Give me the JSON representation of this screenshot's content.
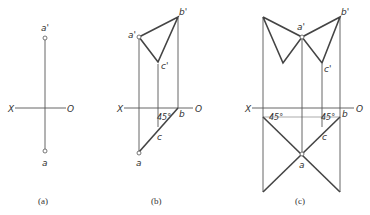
{
  "panels": [
    {
      "id": "a",
      "caption": "(a)",
      "axis": {
        "x_label": "X",
        "o_label": "O"
      },
      "points": {
        "a_prime": "a'",
        "a": "a"
      }
    },
    {
      "id": "b",
      "caption": "(b)",
      "axis": {
        "x_label": "X",
        "o_label": "O"
      },
      "points": {
        "a_prime": "a'",
        "b_prime": "b'",
        "c_prime": "c'",
        "a": "a",
        "b": "b",
        "c": "c"
      },
      "angle": "45°"
    },
    {
      "id": "c",
      "caption": "(c)",
      "axis": {
        "x_label": "X",
        "o_label": "O"
      },
      "points": {
        "a_prime": "a'",
        "b_prime": "b'",
        "c_prime": "c'",
        "a": "a",
        "b": "b",
        "c": "c"
      },
      "angle_left": "45°",
      "angle_right": "45°"
    }
  ]
}
